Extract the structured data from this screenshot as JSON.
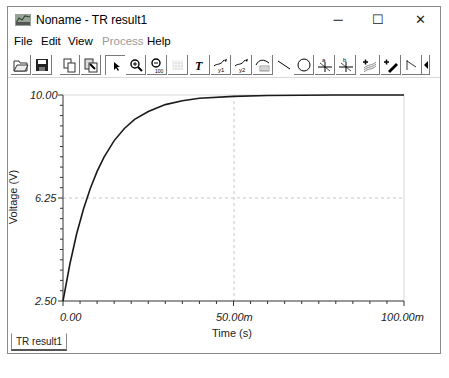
{
  "window": {
    "title": "Noname - TR result1",
    "controls": {
      "minimize": "─",
      "maximize": "☐",
      "close": "✕"
    }
  },
  "menu": {
    "items": [
      {
        "label": "File",
        "enabled": true
      },
      {
        "label": "Edit",
        "enabled": true
      },
      {
        "label": "View",
        "enabled": true
      },
      {
        "label": "Process",
        "enabled": false
      },
      {
        "label": "Help",
        "enabled": true
      }
    ]
  },
  "toolbar": {
    "icons": [
      "open-folder-icon",
      "save-icon",
      "copy-icon",
      "paste-special-icon",
      "select-arrow-icon",
      "zoom-in-icon",
      "zoom-100-icon",
      "grid-icon",
      "text-icon",
      "cursor-a-icon",
      "cursor-b-icon",
      "curve-label-icon",
      "line-icon",
      "circle-icon",
      "marker-a-icon",
      "marker-b-icon",
      "add-curve-icon",
      "add-pen-icon",
      "step-line-icon",
      "scroll-left-icon",
      "scroll-updown-icon",
      "scroll-right-icon"
    ]
  },
  "tabs": [
    {
      "label": "TR result1",
      "active": true
    }
  ],
  "colors": {
    "curve": "#1a1a1a",
    "grid_dashed": "#c8c8c8",
    "axis": "#333333",
    "process_disabled": "#9a9a9a"
  },
  "chart_data": {
    "type": "line",
    "title": "",
    "xlabel": "Time (s)",
    "ylabel": "Voltage (V)",
    "xlim": [
      0,
      0.1
    ],
    "ylim": [
      2.5,
      10.0
    ],
    "x_tick_labels": [
      "0.00",
      "50.00m",
      "100.00m"
    ],
    "y_tick_labels": [
      "2.50",
      "6.25",
      "10.00"
    ],
    "grid": "dashed at midpoints (x=50.00m, y=6.25)",
    "legend": null,
    "series": [
      {
        "name": "V",
        "x": [
          0,
          0.002,
          0.004,
          0.006,
          0.008,
          0.01,
          0.012,
          0.015,
          0.018,
          0.021,
          0.025,
          0.03,
          0.035,
          0.04,
          0.05,
          0.06,
          0.07,
          0.08,
          0.09,
          0.1
        ],
        "values": [
          2.5,
          3.83,
          4.94,
          5.85,
          6.6,
          7.22,
          7.73,
          8.34,
          8.78,
          9.11,
          9.4,
          9.65,
          9.79,
          9.88,
          9.95,
          9.98,
          9.99,
          10.0,
          10.0,
          10.0
        ]
      }
    ]
  }
}
